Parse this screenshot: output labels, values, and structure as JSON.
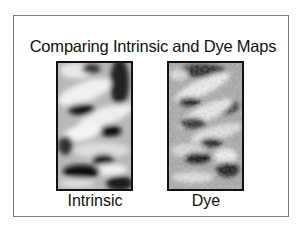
{
  "slide": {
    "title": "Comparing Intrinsic and Dye Maps",
    "panels": [
      {
        "label": "Intrinsic",
        "image": "intrinsic-map-grayscale"
      },
      {
        "label": "Dye",
        "image": "dye-map-grayscale"
      }
    ],
    "colors": {
      "background": "#ffffff",
      "frame": "#7a7a7a",
      "text": "#111111"
    }
  }
}
